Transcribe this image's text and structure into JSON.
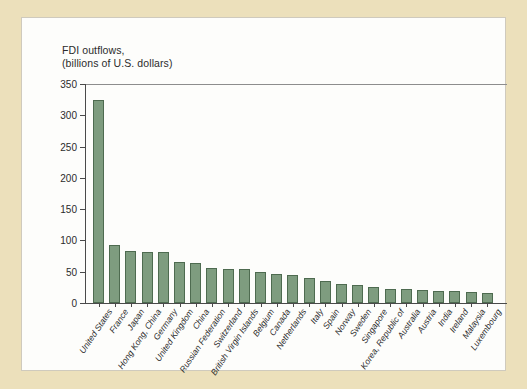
{
  "figure": {
    "background_color": "#ece0bb",
    "panel_color": "#fdfdfb",
    "bar_fill": "#7e9c7f",
    "bar_stroke": "#4e6b50",
    "title_line1": "FDI outflows,",
    "title_line2": "(billions of U.S. dollars)"
  },
  "chart_data": {
    "type": "bar",
    "title": "FDI outflows, (billions of U.S. dollars)",
    "xlabel": "",
    "ylabel": "",
    "ylim": [
      0,
      350
    ],
    "yticks": [
      0,
      50,
      100,
      150,
      200,
      250,
      300,
      350
    ],
    "ytick_labels": [
      "0",
      "50",
      "100",
      "150",
      "200",
      "250",
      "300",
      "350"
    ],
    "grid": false,
    "legend": "none",
    "categories": [
      "United States",
      "France",
      "Japan",
      "Hong Kong, China",
      "Germany",
      "United Kingdom",
      "China",
      "Russian Federation",
      "Switzerland",
      "British Virgin Islands",
      "Belgium",
      "Canada",
      "Netherlands",
      "Italy",
      "Spain",
      "Norway",
      "Sweden",
      "Singapore",
      "Korea, Republic of",
      "Australia",
      "Austria",
      "India",
      "Ireland",
      "Malaysia",
      "Luxembourg"
    ],
    "values": [
      325,
      92,
      83,
      82,
      81,
      66,
      64,
      56,
      55,
      54,
      50,
      47,
      44,
      40,
      35,
      30,
      29,
      25,
      23,
      22,
      21,
      20,
      19,
      18,
      16
    ]
  }
}
